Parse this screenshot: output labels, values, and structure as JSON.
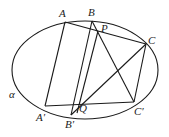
{
  "diagram": {
    "plane_label": "α",
    "points": {
      "A": "A",
      "B": "B",
      "P": "P",
      "C": "C",
      "A_prime": "A′",
      "B_prime": "B′",
      "Q": "Q",
      "C_prime": "C′"
    },
    "segments": [
      [
        "A",
        "P"
      ],
      [
        "P",
        "C"
      ],
      [
        "A",
        "A_prime"
      ],
      [
        "B",
        "B_prime"
      ],
      [
        "C",
        "C_prime"
      ],
      [
        "A_prime",
        "C_prime"
      ],
      [
        "B",
        "C_prime"
      ],
      [
        "P",
        "Q"
      ],
      [
        "Q",
        "C"
      ],
      [
        "B_prime",
        "C"
      ]
    ]
  }
}
